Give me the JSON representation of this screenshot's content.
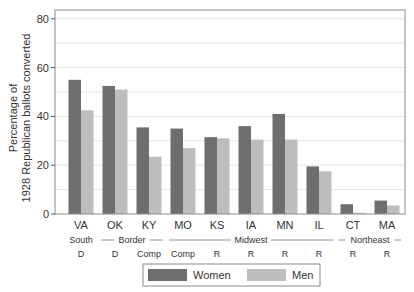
{
  "chart_data": {
    "type": "bar",
    "title": "",
    "xlabel": "",
    "ylabel": [
      "Percentage of",
      "1928 Republican ballots converted"
    ],
    "ylim": [
      0,
      85
    ],
    "yticks": [
      0,
      20,
      40,
      60,
      80
    ],
    "grid": true,
    "legend_position": "bottom",
    "categories": [
      "VA",
      "OK",
      "KY",
      "MO",
      "KS",
      "IA",
      "MN",
      "IL",
      "CT",
      "MA"
    ],
    "category_sublabels": [
      "D",
      "D",
      "Comp",
      "Comp",
      "R",
      "R",
      "R",
      "R",
      "R",
      "R"
    ],
    "region_labels": [
      {
        "text": "South",
        "from": 0,
        "to": 0,
        "dashed": false
      },
      {
        "text": "Border",
        "from": 1,
        "to": 2,
        "dashed": true
      },
      {
        "text": "Midwest",
        "from": 3,
        "to": 7,
        "dashed": true
      },
      {
        "text": "Northeast",
        "from": 8,
        "to": 9,
        "dashed": true
      }
    ],
    "series": [
      {
        "name": "Women",
        "color": "#6e6e6e",
        "values": [
          55,
          52.5,
          35.5,
          35,
          31.5,
          36,
          41,
          19.5,
          4,
          5.5
        ]
      },
      {
        "name": "Men",
        "color": "#bdbdbd",
        "values": [
          42.5,
          51,
          23.5,
          27,
          31,
          30.5,
          30.5,
          17.5,
          0.5,
          3.5
        ]
      }
    ]
  },
  "legend": {
    "items": [
      {
        "label": "Women",
        "color": "#6e6e6e"
      },
      {
        "label": "Men",
        "color": "#bdbdbd"
      }
    ]
  }
}
